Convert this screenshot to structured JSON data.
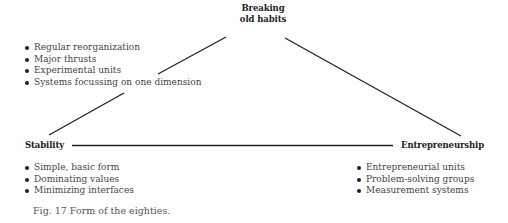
{
  "diagram": {
    "nodes": {
      "top": {
        "line1": "Breaking",
        "line2": "old habits"
      },
      "left": {
        "label": "Stability"
      },
      "right": {
        "label": "Entrepreneurship"
      }
    },
    "lists": {
      "top": [
        "Regular reorganization",
        "Major thrusts",
        "Experimental units",
        "Systems focussing on one dimension"
      ],
      "left": [
        "Simple, basic form",
        "Dominating values",
        "Minimizing interfaces"
      ],
      "right": [
        "Entrepreneurial units",
        "Problem-solving groups",
        "Measurement systems"
      ]
    },
    "line_color": "#222222"
  },
  "caption": "Fig. 17  Form of the eighties."
}
